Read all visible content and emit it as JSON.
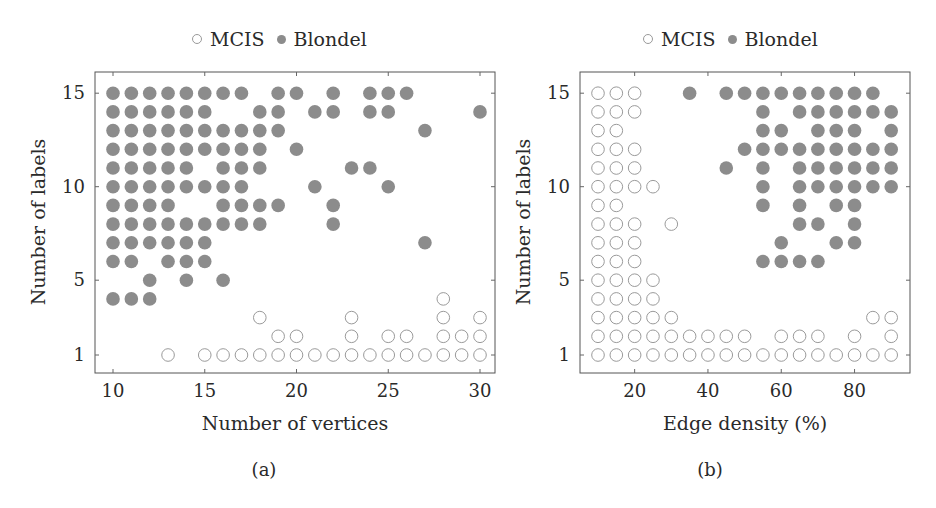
{
  "chart_data": [
    {
      "type": "scatter",
      "panel": "(a)",
      "title": "",
      "xlabel": "Number of vertices",
      "ylabel": "Number of labels",
      "xlim": [
        9,
        31
      ],
      "ylim": [
        0,
        16
      ],
      "xticks": [
        10,
        15,
        20,
        25,
        30
      ],
      "yticks": [
        1,
        5,
        10,
        15
      ],
      "grid": false,
      "legend": {
        "position": "top-center",
        "entries": [
          "MCIS",
          "Blondel"
        ]
      },
      "series": [
        {
          "name": "MCIS",
          "marker": "open-circle",
          "color": "#9a9a9a",
          "points": [
            [
              28,
              4
            ],
            [
              18,
              3
            ],
            [
              23,
              3
            ],
            [
              28,
              3
            ],
            [
              30,
              3
            ],
            [
              19,
              2
            ],
            [
              20,
              2
            ],
            [
              23,
              2
            ],
            [
              25,
              2
            ],
            [
              26,
              2
            ],
            [
              28,
              2
            ],
            [
              29,
              2
            ],
            [
              30,
              2
            ],
            [
              13,
              1
            ],
            [
              15,
              1
            ],
            [
              16,
              1
            ],
            [
              17,
              1
            ],
            [
              18,
              1
            ],
            [
              19,
              1
            ],
            [
              20,
              1
            ],
            [
              21,
              1
            ],
            [
              22,
              1
            ],
            [
              23,
              1
            ],
            [
              24,
              1
            ],
            [
              25,
              1
            ],
            [
              26,
              1
            ],
            [
              27,
              1
            ],
            [
              28,
              1
            ],
            [
              29,
              1
            ],
            [
              30,
              1
            ]
          ]
        },
        {
          "name": "Blondel",
          "marker": "filled-circle",
          "color": "#8c8c8c",
          "points": [
            [
              10,
              15
            ],
            [
              11,
              15
            ],
            [
              12,
              15
            ],
            [
              13,
              15
            ],
            [
              14,
              15
            ],
            [
              15,
              15
            ],
            [
              16,
              15
            ],
            [
              17,
              15
            ],
            [
              19,
              15
            ],
            [
              20,
              15
            ],
            [
              22,
              15
            ],
            [
              24,
              15
            ],
            [
              25,
              15
            ],
            [
              26,
              15
            ],
            [
              10,
              14
            ],
            [
              11,
              14
            ],
            [
              12,
              14
            ],
            [
              13,
              14
            ],
            [
              14,
              14
            ],
            [
              15,
              14
            ],
            [
              18,
              14
            ],
            [
              19,
              14
            ],
            [
              21,
              14
            ],
            [
              22,
              14
            ],
            [
              24,
              14
            ],
            [
              25,
              14
            ],
            [
              30,
              14
            ],
            [
              10,
              13
            ],
            [
              11,
              13
            ],
            [
              12,
              13
            ],
            [
              13,
              13
            ],
            [
              14,
              13
            ],
            [
              15,
              13
            ],
            [
              16,
              13
            ],
            [
              17,
              13
            ],
            [
              18,
              13
            ],
            [
              19,
              13
            ],
            [
              27,
              13
            ],
            [
              10,
              12
            ],
            [
              11,
              12
            ],
            [
              12,
              12
            ],
            [
              13,
              12
            ],
            [
              14,
              12
            ],
            [
              15,
              12
            ],
            [
              16,
              12
            ],
            [
              17,
              12
            ],
            [
              18,
              12
            ],
            [
              20,
              12
            ],
            [
              10,
              11
            ],
            [
              11,
              11
            ],
            [
              12,
              11
            ],
            [
              13,
              11
            ],
            [
              14,
              11
            ],
            [
              16,
              11
            ],
            [
              17,
              11
            ],
            [
              18,
              11
            ],
            [
              23,
              11
            ],
            [
              24,
              11
            ],
            [
              10,
              10
            ],
            [
              11,
              10
            ],
            [
              12,
              10
            ],
            [
              13,
              10
            ],
            [
              14,
              10
            ],
            [
              15,
              10
            ],
            [
              16,
              10
            ],
            [
              17,
              10
            ],
            [
              21,
              10
            ],
            [
              25,
              10
            ],
            [
              10,
              9
            ],
            [
              11,
              9
            ],
            [
              12,
              9
            ],
            [
              13,
              9
            ],
            [
              16,
              9
            ],
            [
              17,
              9
            ],
            [
              18,
              9
            ],
            [
              19,
              9
            ],
            [
              22,
              9
            ],
            [
              10,
              8
            ],
            [
              11,
              8
            ],
            [
              12,
              8
            ],
            [
              13,
              8
            ],
            [
              14,
              8
            ],
            [
              15,
              8
            ],
            [
              16,
              8
            ],
            [
              17,
              8
            ],
            [
              18,
              8
            ],
            [
              22,
              8
            ],
            [
              10,
              7
            ],
            [
              11,
              7
            ],
            [
              12,
              7
            ],
            [
              13,
              7
            ],
            [
              14,
              7
            ],
            [
              15,
              7
            ],
            [
              27,
              7
            ],
            [
              10,
              6
            ],
            [
              11,
              6
            ],
            [
              13,
              6
            ],
            [
              14,
              6
            ],
            [
              15,
              6
            ],
            [
              12,
              5
            ],
            [
              14,
              5
            ],
            [
              16,
              5
            ],
            [
              10,
              4
            ],
            [
              11,
              4
            ],
            [
              12,
              4
            ]
          ]
        }
      ]
    },
    {
      "type": "scatter",
      "panel": "(b)",
      "title": "",
      "xlabel": "Edge density (%)",
      "ylabel": "Number of labels",
      "xlim": [
        5,
        95
      ],
      "ylim": [
        0,
        16
      ],
      "xticks": [
        20,
        40,
        60,
        80
      ],
      "yticks": [
        1,
        5,
        10,
        15
      ],
      "grid": false,
      "legend": {
        "position": "top-center",
        "entries": [
          "MCIS",
          "Blondel"
        ]
      },
      "series": [
        {
          "name": "MCIS",
          "marker": "open-circle",
          "color": "#9a9a9a",
          "points": [
            [
              10,
              15
            ],
            [
              15,
              15
            ],
            [
              20,
              15
            ],
            [
              10,
              14
            ],
            [
              15,
              14
            ],
            [
              20,
              14
            ],
            [
              10,
              13
            ],
            [
              15,
              13
            ],
            [
              10,
              12
            ],
            [
              15,
              12
            ],
            [
              20,
              12
            ],
            [
              10,
              11
            ],
            [
              15,
              11
            ],
            [
              20,
              11
            ],
            [
              10,
              10
            ],
            [
              15,
              10
            ],
            [
              20,
              10
            ],
            [
              25,
              10
            ],
            [
              10,
              9
            ],
            [
              15,
              9
            ],
            [
              10,
              8
            ],
            [
              15,
              8
            ],
            [
              20,
              8
            ],
            [
              30,
              8
            ],
            [
              10,
              7
            ],
            [
              15,
              7
            ],
            [
              20,
              7
            ],
            [
              10,
              6
            ],
            [
              15,
              6
            ],
            [
              20,
              6
            ],
            [
              10,
              5
            ],
            [
              15,
              5
            ],
            [
              20,
              5
            ],
            [
              25,
              5
            ],
            [
              10,
              4
            ],
            [
              15,
              4
            ],
            [
              20,
              4
            ],
            [
              25,
              4
            ],
            [
              10,
              3
            ],
            [
              15,
              3
            ],
            [
              20,
              3
            ],
            [
              25,
              3
            ],
            [
              30,
              3
            ],
            [
              85,
              3
            ],
            [
              90,
              3
            ],
            [
              10,
              2
            ],
            [
              15,
              2
            ],
            [
              20,
              2
            ],
            [
              25,
              2
            ],
            [
              30,
              2
            ],
            [
              35,
              2
            ],
            [
              40,
              2
            ],
            [
              45,
              2
            ],
            [
              50,
              2
            ],
            [
              60,
              2
            ],
            [
              65,
              2
            ],
            [
              70,
              2
            ],
            [
              80,
              2
            ],
            [
              90,
              2
            ],
            [
              10,
              1
            ],
            [
              15,
              1
            ],
            [
              20,
              1
            ],
            [
              25,
              1
            ],
            [
              30,
              1
            ],
            [
              35,
              1
            ],
            [
              40,
              1
            ],
            [
              45,
              1
            ],
            [
              50,
              1
            ],
            [
              55,
              1
            ],
            [
              60,
              1
            ],
            [
              65,
              1
            ],
            [
              70,
              1
            ],
            [
              75,
              1
            ],
            [
              80,
              1
            ],
            [
              85,
              1
            ],
            [
              90,
              1
            ]
          ]
        },
        {
          "name": "Blondel",
          "marker": "filled-circle",
          "color": "#8c8c8c",
          "points": [
            [
              35,
              15
            ],
            [
              45,
              15
            ],
            [
              50,
              15
            ],
            [
              55,
              15
            ],
            [
              60,
              15
            ],
            [
              65,
              15
            ],
            [
              70,
              15
            ],
            [
              75,
              15
            ],
            [
              80,
              15
            ],
            [
              85,
              15
            ],
            [
              55,
              14
            ],
            [
              65,
              14
            ],
            [
              70,
              14
            ],
            [
              75,
              14
            ],
            [
              80,
              14
            ],
            [
              85,
              14
            ],
            [
              90,
              14
            ],
            [
              55,
              13
            ],
            [
              60,
              13
            ],
            [
              70,
              13
            ],
            [
              75,
              13
            ],
            [
              80,
              13
            ],
            [
              90,
              13
            ],
            [
              50,
              12
            ],
            [
              55,
              12
            ],
            [
              60,
              12
            ],
            [
              65,
              12
            ],
            [
              70,
              12
            ],
            [
              75,
              12
            ],
            [
              80,
              12
            ],
            [
              85,
              12
            ],
            [
              90,
              12
            ],
            [
              45,
              11
            ],
            [
              55,
              11
            ],
            [
              65,
              11
            ],
            [
              70,
              11
            ],
            [
              75,
              11
            ],
            [
              80,
              11
            ],
            [
              85,
              11
            ],
            [
              90,
              11
            ],
            [
              55,
              10
            ],
            [
              65,
              10
            ],
            [
              70,
              10
            ],
            [
              75,
              10
            ],
            [
              80,
              10
            ],
            [
              85,
              10
            ],
            [
              90,
              10
            ],
            [
              55,
              9
            ],
            [
              65,
              9
            ],
            [
              75,
              9
            ],
            [
              80,
              9
            ],
            [
              65,
              8
            ],
            [
              70,
              8
            ],
            [
              80,
              8
            ],
            [
              60,
              7
            ],
            [
              75,
              7
            ],
            [
              80,
              7
            ],
            [
              55,
              6
            ],
            [
              60,
              6
            ],
            [
              65,
              6
            ],
            [
              70,
              6
            ]
          ]
        }
      ]
    }
  ],
  "legend": {
    "mcis_label": "MCIS",
    "blondel_label": "Blondel"
  },
  "panels": [
    {
      "caption": "(a)",
      "xlabel": "Number of vertices",
      "ylabel": "Number of labels"
    },
    {
      "caption": "(b)",
      "xlabel": "Edge density (%)",
      "ylabel": "Number of labels"
    }
  ]
}
